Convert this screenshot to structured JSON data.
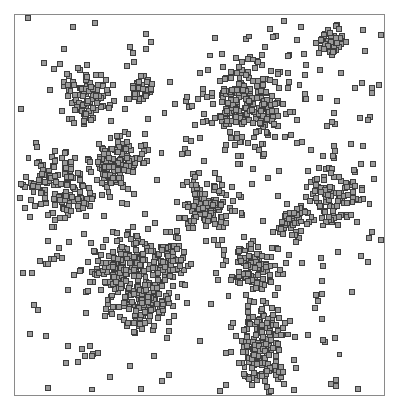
{
  "figure": {
    "kind": "scatter-plot",
    "title": "",
    "width": 399,
    "height": 416,
    "background_color": "#ffffff"
  },
  "plot_area": {
    "frame_visible": true,
    "frame_color": "#8a8a8a",
    "frame_line_width": 1,
    "left": 14,
    "top": 14,
    "width": 371,
    "height": 382,
    "axes_labels_visible": false,
    "tick_labels_visible": false,
    "gridlines_visible": false,
    "legend_visible": false
  },
  "marker": {
    "shape": "square",
    "size_px": 5,
    "fill_color": "#9a9a9a",
    "edge_color": "#3c3c3c",
    "edge_width": 1,
    "opacity": 1
  },
  "chart_data": {
    "type": "scatter",
    "title": "",
    "xlabel": "",
    "ylabel": "",
    "xlim": [
      0,
      1
    ],
    "ylim": [
      0,
      1
    ],
    "grid": false,
    "legend": null,
    "axis_ticks": false,
    "frame": true,
    "marker_shape": "square",
    "marker_fill": "#9a9a9a",
    "marker_edge": "#3c3c3c",
    "n_background_points": 300,
    "n_clusters": 15,
    "background_seed": 20240617,
    "clusters": [
      {
        "id": "c1",
        "cx": 0.2,
        "cy": 0.785,
        "sx": 0.04,
        "sy": 0.035,
        "n": 95,
        "seed": 101
      },
      {
        "id": "c2",
        "cx": 0.348,
        "cy": 0.8,
        "sx": 0.016,
        "sy": 0.015,
        "n": 30,
        "seed": 102
      },
      {
        "id": "c3",
        "cx": 0.64,
        "cy": 0.775,
        "sx": 0.055,
        "sy": 0.06,
        "n": 230,
        "seed": 103
      },
      {
        "id": "c4",
        "cx": 0.86,
        "cy": 0.93,
        "sx": 0.02,
        "sy": 0.02,
        "n": 42,
        "seed": 104
      },
      {
        "id": "c5",
        "cx": 0.285,
        "cy": 0.62,
        "sx": 0.03,
        "sy": 0.03,
        "n": 70,
        "seed": 105
      },
      {
        "id": "c6",
        "cx": 0.12,
        "cy": 0.545,
        "sx": 0.05,
        "sy": 0.04,
        "n": 120,
        "seed": 106
      },
      {
        "id": "c7",
        "cx": 0.265,
        "cy": 0.597,
        "sx": 0.028,
        "sy": 0.026,
        "n": 55,
        "seed": 107
      },
      {
        "id": "c8",
        "cx": 0.525,
        "cy": 0.495,
        "sx": 0.04,
        "sy": 0.032,
        "n": 110,
        "seed": 108
      },
      {
        "id": "c9",
        "cx": 0.855,
        "cy": 0.52,
        "sx": 0.042,
        "sy": 0.035,
        "n": 100,
        "seed": 109
      },
      {
        "id": "c10",
        "cx": 0.745,
        "cy": 0.455,
        "sx": 0.022,
        "sy": 0.022,
        "n": 45,
        "seed": 110
      },
      {
        "id": "c11",
        "cx": 0.29,
        "cy": 0.335,
        "sx": 0.048,
        "sy": 0.048,
        "n": 150,
        "seed": 111
      },
      {
        "id": "c12",
        "cx": 0.41,
        "cy": 0.345,
        "sx": 0.028,
        "sy": 0.028,
        "n": 65,
        "seed": 112
      },
      {
        "id": "c13",
        "cx": 0.35,
        "cy": 0.235,
        "sx": 0.045,
        "sy": 0.032,
        "n": 105,
        "seed": 113
      },
      {
        "id": "c14",
        "cx": 0.65,
        "cy": 0.33,
        "sx": 0.04,
        "sy": 0.035,
        "n": 95,
        "seed": 114
      },
      {
        "id": "c15",
        "cx": 0.672,
        "cy": 0.178,
        "sx": 0.03,
        "sy": 0.042,
        "n": 80,
        "seed": 115
      },
      {
        "id": "c16",
        "cx": 0.668,
        "cy": 0.075,
        "sx": 0.028,
        "sy": 0.035,
        "n": 78,
        "seed": 116
      }
    ],
    "sparse_streaks": [
      {
        "id": "s1",
        "x0": 0.12,
        "y0": 0.47,
        "x1": 0.28,
        "y1": 0.56,
        "n": 14,
        "jitter": 0.014,
        "seed": 201
      },
      {
        "id": "s2",
        "x0": 0.06,
        "y0": 0.33,
        "x1": 0.14,
        "y1": 0.39,
        "n": 8,
        "jitter": 0.016,
        "seed": 202
      },
      {
        "id": "s3",
        "x0": 0.62,
        "y0": 0.09,
        "x1": 0.72,
        "y1": 0.115,
        "n": 7,
        "jitter": 0.012,
        "seed": 203
      },
      {
        "id": "s4",
        "x0": 0.15,
        "y0": 0.09,
        "x1": 0.23,
        "y1": 0.12,
        "n": 6,
        "jitter": 0.013,
        "seed": 204
      }
    ]
  }
}
